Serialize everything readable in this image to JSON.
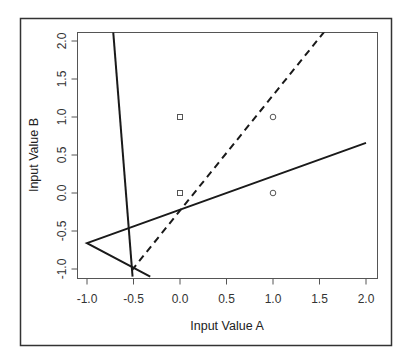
{
  "chart_data": {
    "type": "scatter",
    "title": "",
    "xlabel": "Input Value A",
    "ylabel": "Input Value B",
    "xlim": [
      -1.1,
      2.1
    ],
    "ylim": [
      -1.1,
      2.15
    ],
    "grid": false,
    "legend": null,
    "x_ticks": [
      -1.0,
      -0.5,
      0.0,
      0.5,
      1.0,
      1.5,
      2.0
    ],
    "x_tick_labels": [
      "-1.0",
      "-0.5",
      "0.0",
      "0.5",
      "1.0",
      "1.5",
      "2.0"
    ],
    "y_ticks": [
      -1.0,
      -0.5,
      0.0,
      0.5,
      1.0,
      1.5,
      2.0
    ],
    "y_tick_labels": [
      "-1.0",
      "-0.5",
      "0.0",
      "0.5",
      "1.0",
      "1.5",
      "2.0"
    ],
    "points": [
      {
        "x": 0,
        "y": 1,
        "marker": "square"
      },
      {
        "x": 0,
        "y": 0,
        "marker": "square"
      },
      {
        "x": 1,
        "y": 1,
        "marker": "circle"
      },
      {
        "x": 1,
        "y": 0,
        "marker": "circle"
      }
    ],
    "lines": [
      {
        "name": "near-vertical-boundary",
        "style": "solid",
        "points": [
          [
            -0.72,
            2.15
          ],
          [
            -0.51,
            -1.1
          ]
        ]
      },
      {
        "name": "boundary-polyline",
        "style": "solid",
        "points": [
          [
            2.0,
            0.66
          ],
          [
            -1.0,
            -0.66
          ],
          [
            -0.32,
            -1.1
          ]
        ]
      },
      {
        "name": "dashed-boundary",
        "style": "dashed",
        "points": [
          [
            -0.52,
            -1.02
          ],
          [
            1.57,
            2.15
          ]
        ]
      }
    ]
  },
  "colors": {
    "line": "#1a1a1a",
    "frame": "#333333",
    "axis": "#555555",
    "marker": "#555555"
  }
}
